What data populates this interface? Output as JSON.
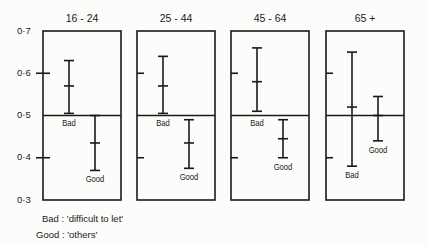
{
  "chart_data": {
    "type": "errorbar",
    "title": "",
    "panels": [
      "16 - 24",
      "25 - 44",
      "45 - 64",
      "65 +"
    ],
    "ylim": [
      0.3,
      0.7
    ],
    "yticks": [
      "0·7",
      "0·6",
      "0·5",
      "0·4",
      "0·3"
    ],
    "ytick_values": [
      0.7,
      0.6,
      0.5,
      0.4,
      0.3
    ],
    "reference_line": 0.5,
    "grid": false,
    "series": [
      {
        "name": "Bad",
        "description": "'difficult to let'",
        "mean": [
          0.57,
          0.57,
          0.58,
          0.52
        ],
        "upper": [
          0.63,
          0.64,
          0.66,
          0.65
        ],
        "lower": [
          0.505,
          0.505,
          0.51,
          0.38
        ]
      },
      {
        "name": "Good",
        "description": "'others'",
        "mean": [
          0.435,
          0.435,
          0.445,
          0.5
        ],
        "upper": [
          0.5,
          0.49,
          0.49,
          0.545
        ],
        "lower": [
          0.37,
          0.375,
          0.4,
          0.44
        ]
      }
    ],
    "point_labels": {
      "Bad": [
        "Bad",
        "Bad",
        "Bad",
        "Bad"
      ],
      "Good": [
        "Good",
        "Good",
        "Good",
        "Good"
      ]
    },
    "legend": [
      {
        "key": "Bad",
        "text": "Bad : 'difficult to let'"
      },
      {
        "key": "Good",
        "text": "Good : 'others'"
      }
    ],
    "legend_position": "bottom-left"
  }
}
